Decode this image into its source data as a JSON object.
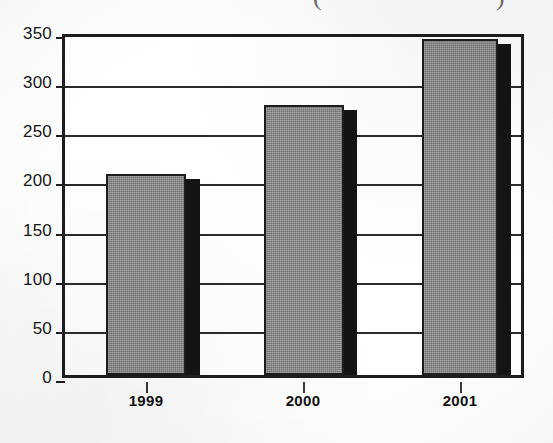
{
  "chart_data": {
    "type": "bar",
    "title": "",
    "title_note": "title cropped off top of image; only bottom tips of enclosing parentheses visible",
    "categories": [
      "1999",
      "2000",
      "2001"
    ],
    "values": [
      205,
      275,
      342
    ],
    "series": [
      {
        "name": "",
        "values": [
          205,
          275,
          342
        ]
      }
    ],
    "xlabel": "",
    "ylabel": "",
    "ylim": [
      0,
      350
    ],
    "yticks": [
      0,
      50,
      100,
      150,
      200,
      250,
      300,
      350
    ],
    "ytick_labels": [
      "0",
      "50",
      "100",
      "150",
      "200",
      "250",
      "300",
      "350"
    ],
    "grid": true,
    "grid_axis": "y",
    "legend": false,
    "legend_position": "none",
    "bar_style": "3d-shadow-right",
    "colors": {
      "bar_fill": "#8d8d8d",
      "bar_outline": "#1d1d1d",
      "bar_shadow": "#141414",
      "gridline": "#2b2b2b",
      "axis": "#1d1d1d",
      "background": "#fdfdfd",
      "text": "#171717"
    }
  },
  "title_remnant": {
    "left_paren": "(",
    "right_paren": ")"
  },
  "axes": {
    "y_labels": [
      "350",
      "300",
      "250",
      "200",
      "150",
      "100",
      "50",
      "0"
    ],
    "x_labels": [
      "1999",
      "2000",
      "2001"
    ]
  }
}
